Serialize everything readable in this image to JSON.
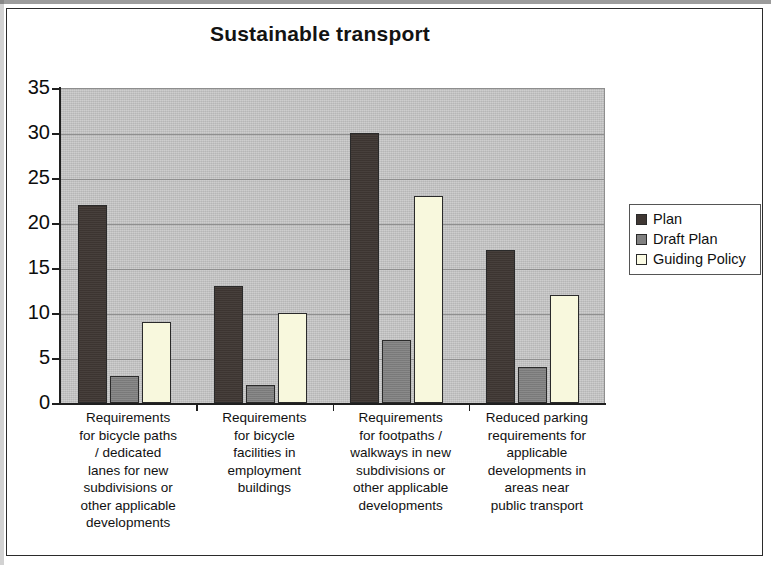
{
  "chart_data": {
    "type": "bar",
    "title": "Sustainable transport",
    "xlabel": "",
    "ylabel": "",
    "ylim": [
      0,
      35
    ],
    "ytick_labels": [
      "35",
      "30",
      "25",
      "20",
      "15",
      "10",
      "5",
      "0"
    ],
    "ytick_values": [
      35,
      30,
      25,
      20,
      15,
      10,
      5,
      0
    ],
    "grid": true,
    "legend_position": "right",
    "categories": [
      "Requirements for bicycle paths / dedicated lanes for new subdivisions or other applicable developments",
      "Requirements for bicycle facilities in employment buildings",
      "Requirements for footpaths / walkways in new subdivisions or other applicable developments",
      "Reduced parking requirements for applicable developments in areas near public transport"
    ],
    "category_lines": [
      [
        "Requirements",
        "for bicycle paths",
        "/ dedicated",
        "lanes for new",
        "subdivisions or",
        "other applicable",
        "developments"
      ],
      [
        "Requirements",
        "for bicycle",
        "facilities in",
        "employment",
        "buildings"
      ],
      [
        "Requirements",
        "for footpaths /",
        "walkways in new",
        "subdivisions or",
        "other applicable",
        "developments"
      ],
      [
        "Reduced parking",
        "requirements for",
        "applicable",
        "developments in",
        "areas near",
        "public transport"
      ]
    ],
    "series": [
      {
        "name": "Plan",
        "color": "#3f3733",
        "values": [
          22,
          13,
          30,
          17
        ]
      },
      {
        "name": "Draft Plan",
        "color": "#808080",
        "values": [
          3,
          2,
          7,
          4
        ]
      },
      {
        "name": "Guiding Policy",
        "color": "#f8f8dd",
        "values": [
          9,
          10,
          23,
          12
        ]
      }
    ]
  },
  "legend": {
    "items": [
      {
        "label": "Plan"
      },
      {
        "label": "Draft Plan"
      },
      {
        "label": "Guiding Policy"
      }
    ]
  }
}
